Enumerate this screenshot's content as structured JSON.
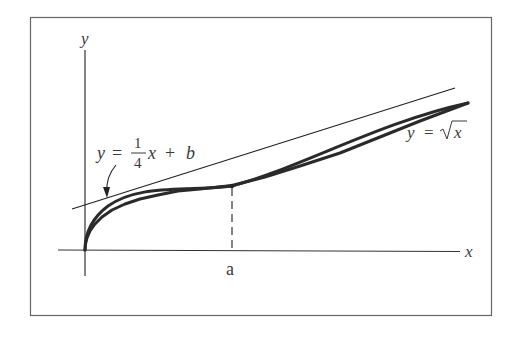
{
  "diagram": {
    "title": "",
    "axes": {
      "x_label": "x",
      "y_label": "y"
    },
    "tick_labels": {
      "a": "a"
    },
    "curves": [
      {
        "name": "sqrt-curve",
        "label": "y = √x",
        "label_lhs": "y",
        "label_eq": "=",
        "label_rhs": "x"
      },
      {
        "name": "tangent-line",
        "label": "y = (1/4)x + b",
        "label_lhs": "y",
        "label_eq": "=",
        "frac_num": "1",
        "frac_den": "4",
        "label_rest": "x + b",
        "label_x": "x",
        "label_plus": "+",
        "label_b": "b"
      }
    ],
    "tangent_point": {
      "x_label": "a"
    },
    "colors": {
      "frame": "#555555",
      "axis": "#333333",
      "curve": "#2a2a2a",
      "tangent": "#222222",
      "text": "#3a3a3a"
    }
  }
}
